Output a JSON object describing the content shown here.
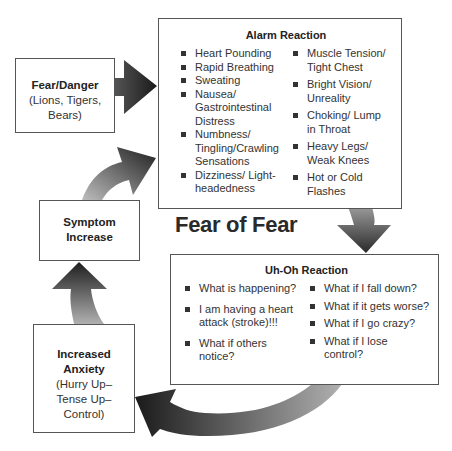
{
  "diagram": {
    "title": "Fear of Fear",
    "nodes": {
      "fear_danger": {
        "title": "Fear/Danger",
        "lines": [
          "(Lions, Tigers,",
          "Bears)"
        ]
      },
      "alarm_reaction": {
        "title": "Alarm Reaction",
        "left_items": [
          "Heart Pounding",
          "Rapid Breathing",
          "Sweating",
          "Nausea/ Gastrointestinal Distress",
          "Numbness/ Tingling/Crawling Sensations",
          "Dizziness/ Light-headedness"
        ],
        "right_items": [
          "Muscle Tension/ Tight Chest",
          "Bright Vision/ Unreality",
          "Choking/ Lump in Throat",
          "Heavy Legs/ Weak Knees",
          "Hot or Cold Flashes"
        ]
      },
      "uh_oh_reaction": {
        "title": "Uh-Oh Reaction",
        "left_items": [
          "What is happening?",
          "I am having a heart attack (stroke)!!!",
          "What if others notice?"
        ],
        "right_items": [
          "What if I fall down?",
          "What if it gets worse?",
          "What if I go crazy?",
          "What if I lose control?"
        ]
      },
      "increased_anxiety": {
        "title_line1": "Increased",
        "title_line2": "Anxiety",
        "lines": [
          "(Hurry Up–",
          "Tense Up–",
          "Control)"
        ]
      },
      "symptom_increase": {
        "title_line1": "Symptom",
        "title_line2": "Increase"
      }
    },
    "edges": [
      {
        "from": "Fear/Danger",
        "to": "Alarm Reaction"
      },
      {
        "from": "Alarm Reaction",
        "to": "Uh-Oh Reaction"
      },
      {
        "from": "Uh-Oh Reaction",
        "to": "Increased Anxiety"
      },
      {
        "from": "Increased Anxiety",
        "to": "Symptom Increase"
      },
      {
        "from": "Symptom Increase",
        "to": "Alarm Reaction"
      }
    ],
    "colors": {
      "arrow_dark": "#1e1e1e",
      "arrow_light": "#a8a8a8",
      "border": "#555555"
    }
  }
}
